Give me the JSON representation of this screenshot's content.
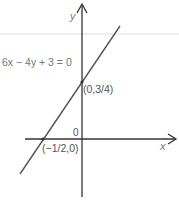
{
  "diagram": {
    "equation": "6x − 4y + 3 = 0",
    "x_axis_label": "x",
    "y_axis_label": "y",
    "origin_label": "0",
    "y_intercept_label": "(0,3/4)",
    "x_intercept_label": "(−1/2,0)",
    "colors": {
      "axis": "#333333",
      "line": "#555555",
      "text": "#777777",
      "guide": "#eeeeee"
    }
  }
}
